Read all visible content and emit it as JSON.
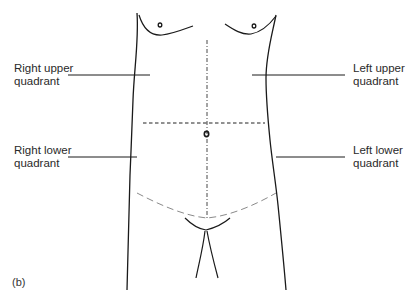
{
  "figure": {
    "panel_label": "(b)",
    "labels": {
      "right_upper": [
        "Right upper",
        "quadrant"
      ],
      "left_upper": [
        "Left upper",
        "quadrant"
      ],
      "right_lower": [
        "Right lower",
        "quadrant"
      ],
      "left_lower": [
        "Left lower",
        "quadrant"
      ]
    },
    "colors": {
      "outline": "#1a1a1a",
      "dashed_lines": "#222222",
      "lower_curve": "#8a8a8a",
      "text": "#2a2a2a"
    },
    "regions": [
      {
        "id": "RUQ",
        "name": "Right upper quadrant"
      },
      {
        "id": "LUQ",
        "name": "Left upper quadrant"
      },
      {
        "id": "RLQ",
        "name": "Right lower quadrant"
      },
      {
        "id": "LLQ",
        "name": "Left lower quadrant"
      }
    ]
  }
}
